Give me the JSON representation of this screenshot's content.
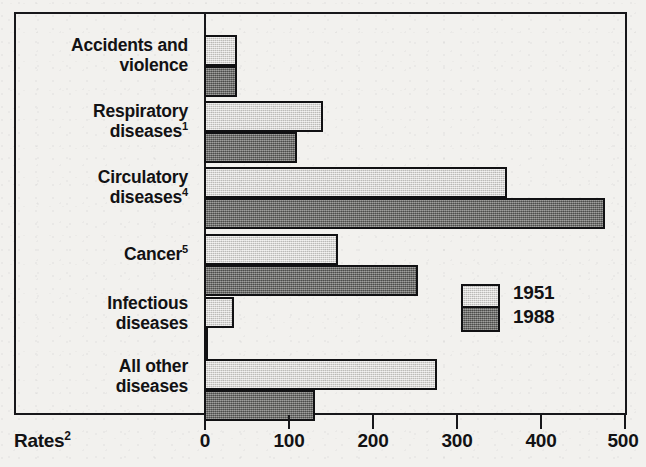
{
  "chart_data": {
    "type": "bar",
    "orientation": "horizontal",
    "title": "",
    "xlabel": "Rates",
    "xlabel_superscript": "2",
    "ylabel": "",
    "xlim": [
      0,
      500
    ],
    "xticks": [
      0,
      100,
      200,
      300,
      400,
      500
    ],
    "xtick_labels": [
      "0",
      "100",
      "200",
      "300",
      "400",
      "500"
    ],
    "grid": false,
    "legend_position": "middle-right",
    "categories": [
      "Accidents and violence",
      "Respiratory diseases",
      "Circulatory diseases",
      "Cancer",
      "Infectious diseases",
      "All other diseases"
    ],
    "category_labels": [
      {
        "line1": "Accidents and",
        "line2": "violence",
        "superscript": ""
      },
      {
        "line1": "Respiratory",
        "line2": "diseases",
        "superscript": "1"
      },
      {
        "line1": "Circulatory",
        "line2": "diseases",
        "superscript": "4"
      },
      {
        "line1": "Cancer",
        "line2": "",
        "superscript": "5"
      },
      {
        "line1": "Infectious",
        "line2": "diseases",
        "superscript": ""
      },
      {
        "line1": "All other",
        "line2": "diseases",
        "superscript": ""
      }
    ],
    "series": [
      {
        "name": "1951",
        "color": "#d2d1cd",
        "values": [
          39,
          142,
          361,
          160,
          36,
          277
        ]
      },
      {
        "name": "1988",
        "color": "#6d6d6a",
        "values": [
          39,
          111,
          477,
          255,
          5,
          132
        ]
      }
    ]
  },
  "legend": {
    "entries": [
      {
        "label": "1951",
        "color": "#d2d1cd"
      },
      {
        "label": "1988",
        "color": "#6d6d6a"
      }
    ]
  },
  "axis": {
    "title_text": "Rates",
    "title_superscript": "2",
    "tick_labels": [
      "0",
      "100",
      "200",
      "300",
      "400",
      "500"
    ]
  },
  "colors": {
    "background": "#f2f1ee",
    "ink": "#121214",
    "frame": "#17171a",
    "series_1951": "#d2d1cd",
    "series_1988": "#6d6d6a"
  }
}
